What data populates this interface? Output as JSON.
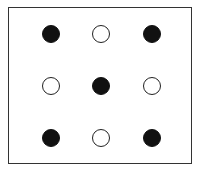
{
  "diagram": {
    "grid": {
      "rows": 3,
      "cols": 3,
      "cells": [
        [
          "filled",
          "empty",
          "filled"
        ],
        [
          "empty",
          "filled",
          "empty"
        ],
        [
          "filled",
          "empty",
          "filled"
        ]
      ]
    },
    "colors": {
      "filled": "#111111",
      "empty": "#ffffff",
      "stroke": "#222222",
      "frame": "#333333"
    }
  }
}
